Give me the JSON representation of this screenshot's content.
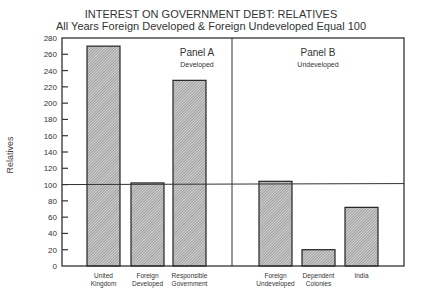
{
  "chart_data": {
    "type": "bar",
    "title": "INTEREST ON GOVERNMENT DEBT: RELATIVES",
    "subtitle": "All Years Foreign Developed & Foreign Undeveloped Equal 100",
    "xlabel": "",
    "ylabel": "Relatives",
    "ylim": [
      0,
      280
    ],
    "yticks": [
      0,
      20,
      40,
      60,
      80,
      100,
      120,
      140,
      160,
      180,
      200,
      220,
      240,
      260,
      280
    ],
    "reference_line": 100,
    "grid": false,
    "legend": null,
    "panels": [
      {
        "title": "Panel A",
        "subtitle": "Developed",
        "categories": [
          [
            "United",
            "Kingdom"
          ],
          [
            "Foreign",
            "Developed"
          ],
          [
            "Responsible",
            "Government"
          ]
        ],
        "values": [
          270,
          102,
          228
        ]
      },
      {
        "title": "Panel B",
        "subtitle": "Undeveloped",
        "categories": [
          [
            "Foreign",
            "Undeveloped"
          ],
          [
            "Dependent",
            "Colonies"
          ],
          [
            "India"
          ]
        ],
        "values": [
          104,
          20,
          72
        ]
      }
    ],
    "colors": {
      "bar_fill": "#b0b0b0",
      "bar_stroke": "#222222",
      "axis": "#333333"
    }
  }
}
